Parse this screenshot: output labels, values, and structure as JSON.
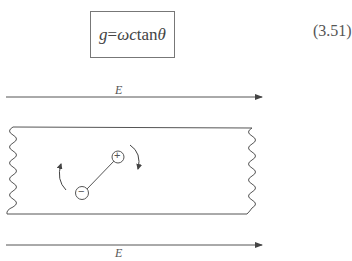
{
  "equation": {
    "lhs": "g",
    "eq": " = ",
    "rhs_vars": "ωc",
    "func": " tan",
    "arg": "θ",
    "number": "(3.51)"
  },
  "figure": {
    "top_field_label": "E",
    "bottom_field_label": "E",
    "positive_charge": "+",
    "negative_charge": "−",
    "colors": {
      "line": "#555555",
      "background": "#ffffff"
    }
  }
}
